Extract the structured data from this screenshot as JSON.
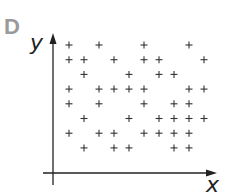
{
  "panel": {
    "label": "D"
  },
  "chart_data": {
    "type": "scatter",
    "title": "",
    "xlabel": "x",
    "ylabel": "y",
    "marker": "+",
    "grid": false,
    "legend": null,
    "note": "Points given in approximate grid units: columns 1-10 (x), rows 1-8 (y, 8 = top)",
    "points": [
      [
        1,
        8
      ],
      [
        3,
        8
      ],
      [
        6,
        8
      ],
      [
        9,
        8
      ],
      [
        1,
        7
      ],
      [
        2,
        7
      ],
      [
        4,
        7
      ],
      [
        6,
        7
      ],
      [
        7,
        7
      ],
      [
        10,
        7
      ],
      [
        2,
        6
      ],
      [
        5,
        6
      ],
      [
        7,
        6
      ],
      [
        8,
        6
      ],
      [
        1,
        5
      ],
      [
        3,
        5
      ],
      [
        4,
        5
      ],
      [
        5,
        5
      ],
      [
        6,
        5
      ],
      [
        9,
        5
      ],
      [
        10,
        5
      ],
      [
        1,
        4
      ],
      [
        3,
        4
      ],
      [
        6,
        4
      ],
      [
        8,
        4
      ],
      [
        9,
        4
      ],
      [
        2,
        3
      ],
      [
        5,
        3
      ],
      [
        7,
        3
      ],
      [
        8,
        3
      ],
      [
        9,
        3
      ],
      [
        10,
        3
      ],
      [
        1,
        2
      ],
      [
        3,
        2
      ],
      [
        4,
        2
      ],
      [
        6,
        2
      ],
      [
        7,
        2
      ],
      [
        8,
        2
      ],
      [
        9,
        2
      ],
      [
        2,
        1
      ],
      [
        4,
        1
      ],
      [
        5,
        1
      ],
      [
        8,
        1
      ],
      [
        9,
        1
      ]
    ]
  }
}
